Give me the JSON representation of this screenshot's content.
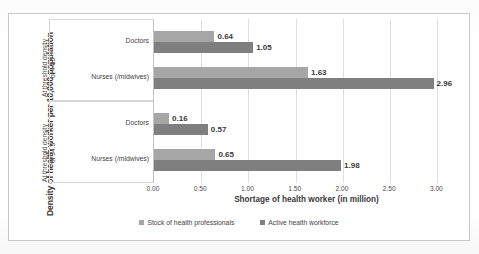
{
  "chart_data": {
    "type": "bar",
    "orientation": "horizontal",
    "title": "",
    "xlabel": "Shortage of health worker (in million)",
    "ylabel": "Density of health worker per 10,000 population",
    "xlim": [
      0.0,
      3.25
    ],
    "xticks": [
      "0.00",
      "0.50",
      "1.00",
      "1.50",
      "2.00",
      "2.50",
      "3.00"
    ],
    "xtick_values": [
      0.0,
      0.5,
      1.0,
      1.5,
      2.0,
      2.5,
      3.0
    ],
    "grid": true,
    "legend_position": "bottom",
    "series": [
      {
        "name": "Stock of health professionals",
        "color": "#a6a6a6",
        "values": [
          0.64,
          1.63,
          0.16,
          0.65
        ]
      },
      {
        "name": "Active health workforce",
        "color": "#7f7f7f",
        "values": [
          1.05,
          2.96,
          0.57,
          1.98
        ]
      }
    ],
    "categories": [
      "Doctors",
      "Nurses (/midwives)",
      "Doctors",
      "Nurses (/midwives)"
    ],
    "groups": [
      {
        "label": "At threshold density\nof 44.5",
        "categories": [
          "Doctors",
          "Nurses (/midwives)"
        ]
      },
      {
        "label": "At threshold density\nof 34.5",
        "categories": [
          "Doctors",
          "Nurses (/midwives)"
        ]
      }
    ],
    "bars": [
      {
        "group": 0,
        "category": "Doctors",
        "series": "Stock of health professionals",
        "value": 0.64,
        "label": "0.64"
      },
      {
        "group": 0,
        "category": "Doctors",
        "series": "Active health workforce",
        "value": 1.05,
        "label": "1.05"
      },
      {
        "group": 0,
        "category": "Nurses (/midwives)",
        "series": "Stock of health professionals",
        "value": 1.63,
        "label": "1.63"
      },
      {
        "group": 0,
        "category": "Nurses (/midwives)",
        "series": "Active health workforce",
        "value": 2.96,
        "label": "2.96"
      },
      {
        "group": 1,
        "category": "Doctors",
        "series": "Stock of health professionals",
        "value": 0.16,
        "label": "0.16"
      },
      {
        "group": 1,
        "category": "Doctors",
        "series": "Active health workforce",
        "value": 0.57,
        "label": "0.57"
      },
      {
        "group": 1,
        "category": "Nurses (/midwives)",
        "series": "Stock of health professionals",
        "value": 0.65,
        "label": "0.65"
      },
      {
        "group": 1,
        "category": "Nurses (/midwives)",
        "series": "Active health workforce",
        "value": 1.98,
        "label": "1.98"
      }
    ]
  },
  "legend": {
    "items": [
      {
        "label": "Stock of health professionals",
        "color": "#a6a6a6"
      },
      {
        "label": "Active health workforce",
        "color": "#7f7f7f"
      }
    ]
  },
  "colors": {
    "series_stock": "#a6a6a6",
    "series_active": "#7f7f7f",
    "gridline": "#dedede",
    "frame": "#c9c9c9",
    "text": "#3f3f3f"
  }
}
